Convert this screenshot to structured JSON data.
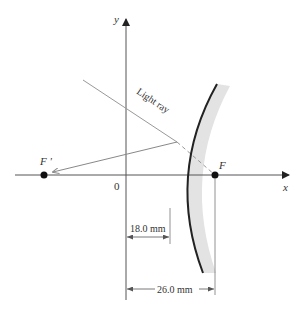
{
  "diagram": {
    "type": "convex-mirror-ray-diagram",
    "axes": {
      "x_label": "x",
      "y_label": "y",
      "origin_label": "0"
    },
    "points": {
      "focal_point": "F",
      "virtual_focal_point": "F '"
    },
    "ray": {
      "label": "Light ray"
    },
    "dimensions": {
      "mirror_vertex_distance": "18.0 mm",
      "focal_distance": "26.0 mm"
    },
    "colors": {
      "axis": "#555555",
      "mirror": "#222222",
      "mirror_shade": "#e3e3e3",
      "ray": "#888888",
      "point": "#111111",
      "text": "#333333"
    }
  }
}
